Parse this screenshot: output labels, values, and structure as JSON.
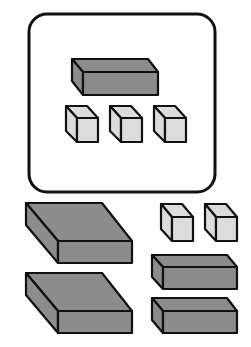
{
  "colors": {
    "stroke": "#111111",
    "dark_block": "#8c8c8c",
    "light_cube": "#dcdcdc",
    "background": "#ffffff"
  },
  "diagram": {
    "framed_group": {
      "rods": 1,
      "units": 3
    },
    "loose_pieces": {
      "flats": 2,
      "units": 2,
      "rods": 2
    }
  }
}
